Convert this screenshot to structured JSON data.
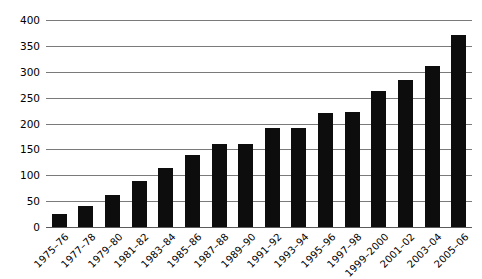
{
  "chart_data": {
    "type": "bar",
    "title": "",
    "subtitle": "",
    "xlabel": "",
    "ylabel": "",
    "ylim": [
      0,
      400
    ],
    "yticks": [
      0,
      50,
      100,
      150,
      200,
      250,
      300,
      350,
      400
    ],
    "grid": true,
    "legend": false,
    "bar_color": "#0d0d0d",
    "gridline_color": "#7a7a7a",
    "categories": [
      "1975–76",
      "1977–78",
      "1979–80",
      "1981–82",
      "1983–84",
      "1985–86",
      "1987–88",
      "1989–90",
      "1991–92",
      "1993–94",
      "1995–96",
      "1997–98",
      "1999–2000",
      "2001–02",
      "2003–04",
      "2005–06"
    ],
    "values": [
      25,
      40,
      62,
      88,
      115,
      140,
      160,
      160,
      192,
      192,
      220,
      222,
      262,
      285,
      312,
      372
    ]
  }
}
